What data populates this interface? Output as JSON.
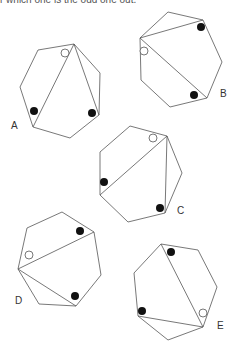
{
  "caption": "r which one is the odd one out.",
  "figures": [
    {
      "label": "A",
      "label_pos": [
        11,
        129
      ],
      "polygon": [
        [
          38,
          50
        ],
        [
          74,
          44
        ],
        [
          100,
          73
        ],
        [
          99,
          115
        ],
        [
          70,
          138
        ],
        [
          33,
          127
        ],
        [
          20,
          87
        ]
      ],
      "diagonals": [
        [
          [
            74,
            44
          ],
          [
            33,
            127
          ]
        ],
        [
          [
            74,
            44
          ],
          [
            99,
            115
          ]
        ]
      ],
      "black_dots": [
        [
          34,
          111
        ],
        [
          92,
          113
        ]
      ],
      "white_dots": [
        [
          65,
          53
        ]
      ]
    },
    {
      "label": "B",
      "label_pos": [
        220,
        97
      ],
      "polygon": [
        [
          168,
          12
        ],
        [
          203,
          20
        ],
        [
          222,
          62
        ],
        [
          207,
          98
        ],
        [
          170,
          107
        ],
        [
          141,
          80
        ],
        [
          140,
          38
        ]
      ],
      "diagonals": [
        [
          [
            140,
            38
          ],
          [
            203,
            20
          ]
        ],
        [
          [
            140,
            38
          ],
          [
            207,
            98
          ]
        ]
      ],
      "black_dots": [
        [
          201,
          27
        ],
        [
          194,
          95
        ]
      ],
      "white_dots": [
        [
          144,
          51
        ]
      ]
    },
    {
      "label": "C",
      "label_pos": [
        177,
        214
      ],
      "polygon": [
        [
          130,
          126
        ],
        [
          167,
          136
        ],
        [
          182,
          173
        ],
        [
          165,
          213
        ],
        [
          128,
          222
        ],
        [
          100,
          195
        ],
        [
          100,
          152
        ]
      ],
      "diagonals": [
        [
          [
            167,
            136
          ],
          [
            100,
            195
          ]
        ],
        [
          [
            167,
            136
          ],
          [
            165,
            213
          ]
        ]
      ],
      "black_dots": [
        [
          104,
          182
        ],
        [
          160,
          208
        ]
      ],
      "white_dots": [
        [
          153,
          138
        ]
      ]
    },
    {
      "label": "D",
      "label_pos": [
        15,
        304
      ],
      "polygon": [
        [
          62,
          212
        ],
        [
          94,
          232
        ],
        [
          101,
          275
        ],
        [
          76,
          306
        ],
        [
          39,
          304
        ],
        [
          18,
          269
        ],
        [
          27,
          228
        ]
      ],
      "diagonals": [
        [
          [
            18,
            269
          ],
          [
            94,
            232
          ]
        ],
        [
          [
            18,
            269
          ],
          [
            76,
            306
          ]
        ]
      ],
      "black_dots": [
        [
          80,
          231
        ],
        [
          75,
          296
        ]
      ],
      "white_dots": [
        [
          29,
          255
        ]
      ]
    },
    {
      "label": "E",
      "label_pos": [
        217,
        329
      ],
      "polygon": [
        [
          161,
          244
        ],
        [
          198,
          250
        ],
        [
          217,
          287
        ],
        [
          203,
          327
        ],
        [
          168,
          340
        ],
        [
          138,
          316
        ],
        [
          134,
          273
        ]
      ],
      "diagonals": [
        [
          [
            203,
            327
          ],
          [
            161,
            244
          ]
        ],
        [
          [
            203,
            327
          ],
          [
            138,
            316
          ]
        ]
      ],
      "black_dots": [
        [
          171,
          252
        ],
        [
          142,
          311
        ]
      ],
      "white_dots": [
        [
          203,
          313
        ]
      ]
    }
  ],
  "style": {
    "stroke": "#555555",
    "dot_fill": "#111111",
    "white_dot_fill": "#ffffff",
    "dot_radius": 4
  }
}
